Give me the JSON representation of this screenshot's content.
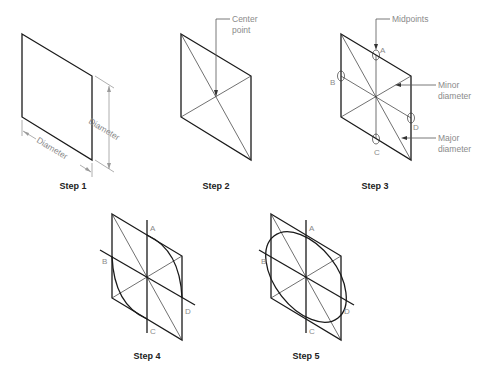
{
  "figure": {
    "steps": [
      {
        "label": "Step 1",
        "annotations": {
          "dim_vertical": "Diameter",
          "dim_horizontal": "Diameter"
        }
      },
      {
        "label": "Step 2",
        "annotations": {
          "callout": "Center point"
        }
      },
      {
        "label": "Step 3",
        "annotations": {
          "midpoints": "Midpoints",
          "minor": "Minor diameter",
          "major": "Major diameter",
          "points": [
            "A",
            "B",
            "C",
            "D"
          ]
        }
      },
      {
        "label": "Step 4",
        "annotations": {
          "points": [
            "A",
            "B",
            "C",
            "D"
          ]
        }
      },
      {
        "label": "Step 5",
        "annotations": {
          "points": [
            "A",
            "B",
            "C",
            "D"
          ]
        }
      }
    ],
    "labels": {
      "center_point_line1": "Center",
      "center_point_line2": "point",
      "midpoints": "Midpoints",
      "minor_line1": "Minor",
      "minor_line2": "diameter",
      "major_line1": "Major",
      "major_line2": "diameter",
      "diameter": "Diameter",
      "A": "A",
      "B": "B",
      "C": "C",
      "D": "D"
    },
    "colors": {
      "line": "#1a1a1a",
      "annotation": "#8a8a8a"
    }
  }
}
